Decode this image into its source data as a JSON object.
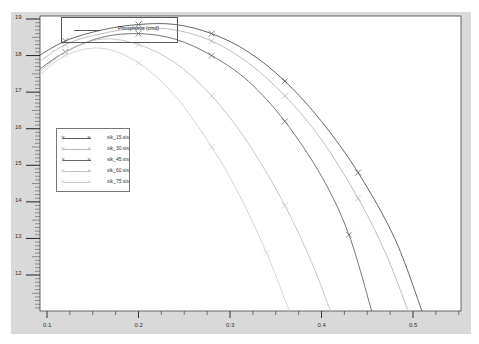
{
  "chart_data": {
    "type": "line",
    "title": "Phosphorus (cmd)",
    "xlabel": "",
    "ylabel": "",
    "xlim": [
      0.085,
      0.63
    ],
    "ylim": [
      11.0,
      19.1
    ],
    "x_ticks": [
      "0.1",
      "0.2",
      "0.3",
      "0.4",
      "0.5"
    ],
    "y_ticks": [
      "19",
      "18",
      "17",
      "16",
      "15",
      "14",
      "13",
      "12"
    ],
    "grid": false,
    "legend_position": "left-middle",
    "series": [
      {
        "name": "sik_15.sis",
        "color": "#555555",
        "x": [
          0.085,
          0.12,
          0.16,
          0.2,
          0.24,
          0.28,
          0.32,
          0.36,
          0.4,
          0.44,
          0.48,
          0.51
        ],
        "y": [
          17.9,
          18.4,
          18.7,
          18.85,
          18.85,
          18.6,
          18.1,
          17.3,
          16.2,
          14.8,
          13.0,
          11.0
        ]
      },
      {
        "name": "sik_30.sis",
        "color": "#b5b5b5",
        "x": [
          0.085,
          0.12,
          0.16,
          0.2,
          0.24,
          0.28,
          0.32,
          0.36,
          0.4,
          0.44,
          0.47,
          0.495
        ],
        "y": [
          17.7,
          18.3,
          18.6,
          18.75,
          18.7,
          18.4,
          17.8,
          16.9,
          15.7,
          14.1,
          12.6,
          11.0
        ]
      },
      {
        "name": "sik_45.sis",
        "color": "#666666",
        "x": [
          0.085,
          0.12,
          0.16,
          0.2,
          0.24,
          0.28,
          0.32,
          0.36,
          0.4,
          0.43,
          0.455
        ],
        "y": [
          17.5,
          18.1,
          18.5,
          18.6,
          18.45,
          18.0,
          17.3,
          16.2,
          14.7,
          13.1,
          11.0
        ]
      },
      {
        "name": "sik_60.sis",
        "color": "#c0c0c0",
        "x": [
          0.085,
          0.12,
          0.16,
          0.2,
          0.24,
          0.28,
          0.32,
          0.36,
          0.39,
          0.41
        ],
        "y": [
          17.4,
          18.1,
          18.45,
          18.3,
          17.8,
          16.9,
          15.6,
          13.9,
          12.3,
          11.0
        ]
      },
      {
        "name": "sik_75.sis",
        "color": "#cfcfcf",
        "x": [
          0.085,
          0.12,
          0.16,
          0.2,
          0.24,
          0.28,
          0.31,
          0.34,
          0.365
        ],
        "y": [
          17.3,
          18.0,
          18.2,
          17.8,
          16.9,
          15.5,
          14.2,
          12.6,
          11.0
        ]
      }
    ]
  },
  "axes": {
    "y_labels": [
      "19",
      "18",
      "17",
      "16",
      "15",
      "14",
      "13",
      "12"
    ],
    "x_labels": [
      "0.1",
      "0.2",
      "0.3",
      "0.4",
      "0.5"
    ]
  },
  "legend": {
    "items": [
      {
        "label": "sik_15.sis",
        "color": "#555555"
      },
      {
        "label": "sik_30.sis",
        "color": "#b5b5b5"
      },
      {
        "label": "sik_45.sis",
        "color": "#666666"
      },
      {
        "label": "sik_60.sis",
        "color": "#c0c0c0"
      },
      {
        "label": "sik_75.sis",
        "color": "#cfcfcf"
      }
    ]
  },
  "title_box": {
    "label": "Phosphorus (cmd)"
  }
}
